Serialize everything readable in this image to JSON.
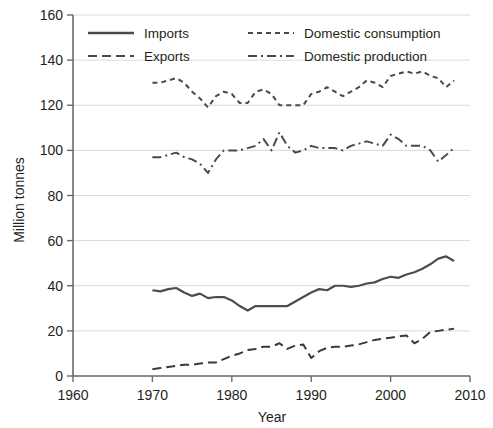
{
  "chart_data": {
    "type": "line",
    "title": "",
    "xlabel": "Year",
    "ylabel": "Million tonnes",
    "xlim": [
      1960,
      2010
    ],
    "ylim": [
      0,
      160
    ],
    "xticks": [
      1960,
      1970,
      1980,
      1990,
      2000,
      2010
    ],
    "yticks": [
      0,
      20,
      40,
      60,
      80,
      100,
      120,
      140,
      160
    ],
    "grid": "horizontal",
    "legend_position": "top-inside",
    "x": [
      1970,
      1971,
      1972,
      1973,
      1974,
      1975,
      1976,
      1977,
      1978,
      1979,
      1980,
      1981,
      1982,
      1983,
      1984,
      1985,
      1986,
      1987,
      1988,
      1989,
      1990,
      1991,
      1992,
      1993,
      1994,
      1995,
      1996,
      1997,
      1998,
      1999,
      2000,
      2001,
      2002,
      2003,
      2004,
      2005,
      2006,
      2007,
      2008
    ],
    "series": [
      {
        "name": "Imports",
        "style": "solid",
        "color": "#4d4d4d",
        "values": [
          38,
          37.5,
          38.5,
          39,
          37,
          35.5,
          36.5,
          34.5,
          35,
          35,
          33.5,
          31,
          29,
          31,
          31,
          31,
          31,
          31,
          33,
          35,
          37,
          38.5,
          38,
          40,
          40,
          39.5,
          40,
          41,
          41.5,
          43,
          44,
          43.5,
          45,
          46,
          47.5,
          49.5,
          52,
          53,
          51
        ]
      },
      {
        "name": "Exports",
        "style": "dashed",
        "color": "#3a3a3a",
        "values": [
          3,
          3.5,
          4,
          4.5,
          5,
          5,
          5.5,
          6,
          6,
          7.5,
          9,
          10,
          11.5,
          12,
          13,
          13,
          14.5,
          12,
          13.5,
          14,
          8,
          11,
          12.5,
          13,
          13,
          13.5,
          14,
          15,
          16,
          16.5,
          17,
          17.5,
          18,
          14.5,
          16.5,
          19.5,
          20,
          20.5,
          21
        ]
      },
      {
        "name": "Domestic consumption",
        "style": "fine-dashed",
        "color": "#4a4a4a",
        "values": [
          130,
          130,
          131,
          132,
          130,
          126,
          123,
          119,
          124,
          126,
          125,
          121,
          121,
          126,
          127,
          125,
          120,
          120,
          120,
          120,
          125,
          126,
          128,
          126,
          124,
          126,
          128,
          131,
          130,
          128,
          133,
          134,
          135,
          134,
          135,
          133,
          132,
          128,
          131
        ]
      },
      {
        "name": "Domestic production",
        "style": "dash-dot",
        "color": "#4a4a4a",
        "values": [
          97,
          97,
          98,
          99,
          97,
          96,
          94,
          90,
          96,
          100,
          100,
          100,
          101,
          102,
          105,
          100,
          108,
          102,
          99,
          100,
          102,
          101,
          101,
          101,
          100,
          102,
          103,
          104,
          103,
          102,
          107,
          105,
          102,
          102,
          102,
          100,
          95,
          98,
          101
        ]
      }
    ]
  },
  "axes": {
    "ylabel": "Million tonnes",
    "xlabel": "Year",
    "xticks": [
      "1960",
      "1970",
      "1980",
      "1990",
      "2000",
      "2010"
    ],
    "yticks": [
      "0",
      "20",
      "40",
      "60",
      "80",
      "100",
      "120",
      "140",
      "160"
    ]
  },
  "legend": {
    "items": [
      {
        "label": "Imports",
        "style": "solid"
      },
      {
        "label": "Domestic consumption",
        "style": "fine-dashed"
      },
      {
        "label": "Exports",
        "style": "dashed"
      },
      {
        "label": "Domestic production",
        "style": "dash-dot"
      }
    ]
  },
  "colors": {
    "line": "#4a4a4a",
    "grid": "#d9d9d9",
    "axis": "#6b6b6b",
    "text": "#231f20",
    "background": "#ffffff"
  }
}
